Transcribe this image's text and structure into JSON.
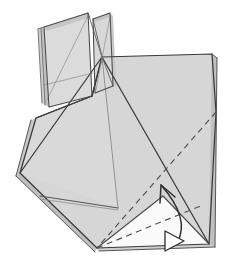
{
  "figure": {
    "kind": "origami-fold-diagram",
    "title": "Origami folding step diagram",
    "canvas": {
      "width": 248,
      "height": 269
    }
  },
  "colors": {
    "background": "#ffffff",
    "paper_face": "#d6d6d6",
    "paper_face_light": "#dedede",
    "paper_face_pale": "#f2f2f2",
    "paper_face_white": "#fbfbfb",
    "paper_edge_shadow": "#b9b9b9",
    "outline": "#3a3a3a",
    "outline_soft": "#6e6e6e",
    "crease_line": "#7a7a7a",
    "dashed_line": "#555555",
    "arrow": "#2f2f2f",
    "arrowhead_hollow_fill": "#ffffff"
  },
  "shapes": {
    "flap_back": {
      "name": "upright-back-flap",
      "points": "44,26 88,12 92,96 49,106",
      "fill": "#dcdcdc"
    },
    "flap_back_top_edge": {
      "name": "upright-back-flap-top-edge",
      "points": "44,26 88,12 91,16 47,30",
      "fill": "#c6c6c6"
    },
    "flap_back_left_edge": {
      "name": "upright-back-flap-left-edge",
      "points": "41,27 44,26 49,106 45,104",
      "fill": "#c2c2c2"
    },
    "flap_front": {
      "name": "upright-front-flap",
      "points": "92,18 110,12 113,86 95,92",
      "fill": "#d9d9d9"
    },
    "flap_front_top_edge": {
      "name": "upright-front-flap-top-edge",
      "points": "92,18 110,12 112,15 94,21",
      "fill": "#c4c4c4"
    },
    "body_main": {
      "name": "main-body-face",
      "points": "102,57 212,54 216,110 209,244 97,248 20,173 36,118 92,96",
      "fill": "#d6d6d6"
    },
    "body_left_wing": {
      "name": "left-wing-face",
      "points": "20,173 36,118 92,96 102,57 118,208 40,196",
      "fill": "#d8d8d8"
    },
    "body_right_panel": {
      "name": "right-panel-face",
      "points": "102,57 212,54 216,112 209,244",
      "fill": "#d3d3d3"
    },
    "under_triangle": {
      "name": "under-flap-triangle",
      "points": "97,248 209,244 163,196",
      "fill": "#fafafa"
    },
    "left_edge_layer": {
      "name": "left-edge-paper-layer",
      "points": "20,173 17,175 96,251 97,248",
      "fill": "#bdbdbd"
    },
    "right_edge_layer": {
      "name": "right-edge-paper-layer",
      "points": "212,54 216,57 214,246 209,244",
      "fill": "#c0c0c0"
    }
  },
  "creases": {
    "solid": [
      {
        "name": "crease-apex-to-left-corner",
        "d": "M102,57 L20,173"
      },
      {
        "name": "crease-apex-to-bottom-right",
        "d": "M102,57 L209,244"
      },
      {
        "name": "crease-apex-to-bottom-mid",
        "d": "M102,57 L118,208"
      },
      {
        "name": "crease-apex-to-right-top",
        "d": "M102,57 L212,54"
      },
      {
        "name": "crease-left-notch",
        "d": "M92,96 L36,118"
      },
      {
        "name": "crease-flap-diagonal-back",
        "d": "M47,98 L88,18"
      },
      {
        "name": "crease-flap-diagonal-front",
        "d": "M95,88 L110,16"
      },
      {
        "name": "crease-flap-horizontal",
        "d": "M45,84 L92,72"
      },
      {
        "name": "crease-triangle-left-edge",
        "d": "M97,248 L163,196"
      },
      {
        "name": "crease-triangle-right-edge",
        "d": "M163,196 L209,244"
      },
      {
        "name": "crease-bottom-edge",
        "d": "M97,248 L209,244"
      },
      {
        "name": "crease-left-bottom-edge",
        "d": "M20,173 L97,248"
      },
      {
        "name": "crease-wing-bottom",
        "d": "M40,196 L118,208"
      }
    ],
    "dashed": [
      {
        "name": "fold-crease-main-dashed",
        "d": "M216,112 L97,248"
      },
      {
        "name": "fold-crease-triangle-dashed",
        "d": "M97,248 L209,244"
      }
    ]
  },
  "annotations": {
    "fold_arrow": {
      "name": "valley-fold-arrow",
      "path": "M176,241 C186,222 172,200 160,184",
      "head": "M160,184 L172,196 M160,184 L158,200",
      "meaning": "fold this flap upward"
    },
    "push_arrowhead": {
      "name": "push-in-hollow-arrowhead",
      "points": "164,232 182,241 164,250",
      "meaning": "push / open out in this direction"
    }
  },
  "legend": {
    "solid_line_label": "visible edge",
    "dashed_line_label": "hidden fold crease",
    "solid_arrow_label": "fold direction",
    "hollow_arrow_label": "push direction"
  }
}
